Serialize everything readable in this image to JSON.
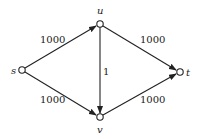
{
  "graph": {
    "type": "directed-flow-network",
    "nodes": [
      {
        "id": "s",
        "label": "s",
        "x": 22,
        "y": 70
      },
      {
        "id": "u",
        "label": "u",
        "x": 100,
        "y": 24
      },
      {
        "id": "t",
        "label": "t",
        "x": 180,
        "y": 72
      },
      {
        "id": "v",
        "label": "v",
        "x": 100,
        "y": 117
      }
    ],
    "edges": [
      {
        "from": "s",
        "to": "u",
        "capacity": "1000"
      },
      {
        "from": "s",
        "to": "v",
        "capacity": "1000"
      },
      {
        "from": "u",
        "to": "t",
        "capacity": "1000"
      },
      {
        "from": "v",
        "to": "t",
        "capacity": "1000"
      },
      {
        "from": "u",
        "to": "v",
        "capacity": "1"
      }
    ]
  },
  "colors": {
    "stroke": "#222222",
    "node_fill": "#ffffff",
    "background": "#ffffff"
  }
}
